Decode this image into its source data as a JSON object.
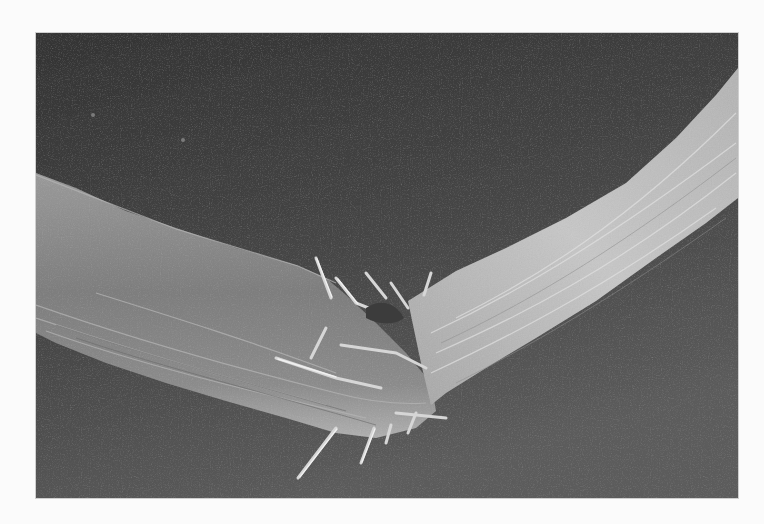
{
  "image": {
    "subject": "scanning-electron-micrograph-broken-fiber",
    "colormode": "grayscale",
    "colors": {
      "page_background": "#fbfbfb",
      "frame_background_top": "#3a3a3a",
      "frame_background_bottom": "#5a5a5a",
      "fiber_left": "#8a8a8a",
      "fiber_right": "#b8b8b8",
      "fibril_highlight": "#dcdcdc"
    },
    "frame": {
      "x": 36,
      "y": 33,
      "width": 702,
      "height": 465
    }
  }
}
